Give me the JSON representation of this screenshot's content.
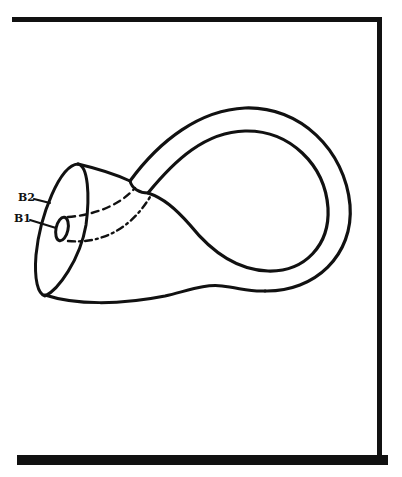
{
  "figure": {
    "labels": {
      "b2": "B2",
      "b1": "B1"
    },
    "colors": {
      "ink": "#111111",
      "background": "#ffffff"
    }
  }
}
